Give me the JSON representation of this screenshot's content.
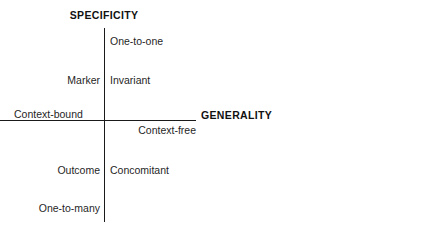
{
  "diagram": {
    "background_color": "#ffffff",
    "line_color": "#1a1a1a",
    "text_color": "#1f1f1f",
    "axes": {
      "vertical_title": "SPECIFICITY",
      "horizontal_title": "GENERALITY"
    },
    "labels": {
      "top": "One-to-one",
      "upper_left": "Marker",
      "upper_right": "Invariant",
      "left": "Context-bound",
      "right": "Context-free",
      "lower_left": "Outcome",
      "lower_right": "Concomitant",
      "bottom": "One-to-many"
    }
  },
  "chart_data": {
    "type": "diagram",
    "subtype": "two-axis-quadrant",
    "title": "",
    "xlabel": "GENERALITY",
    "ylabel": "SPECIFICITY",
    "axis_poles": {
      "y_high": "One-to-one",
      "y_low": "One-to-many",
      "x_low": "Context-bound",
      "x_high": "Context-free"
    },
    "quadrants": [
      {
        "position": "upper-left",
        "label": "Marker",
        "x": "context-bound",
        "y": "high-specificity"
      },
      {
        "position": "upper-right",
        "label": "Invariant",
        "x": "context-free",
        "y": "high-specificity"
      },
      {
        "position": "lower-left",
        "label": "Outcome",
        "x": "context-bound",
        "y": "low-specificity"
      },
      {
        "position": "lower-right",
        "label": "Concomitant",
        "x": "context-free",
        "y": "low-specificity"
      }
    ],
    "grid": false,
    "legend": null
  }
}
